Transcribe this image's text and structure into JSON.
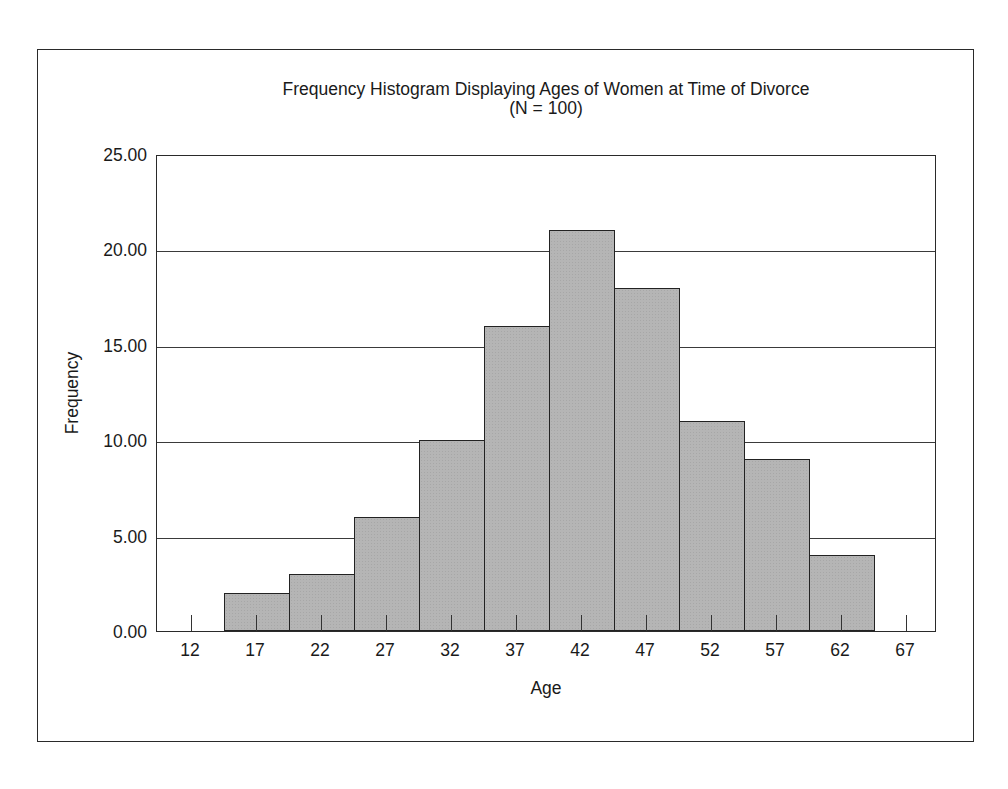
{
  "chart": {
    "title": "Frequency Histogram Displaying Ages of Women at Time of Divorce",
    "subtitle": "(N = 100)",
    "xlabel": "Age",
    "ylabel": "Frequency",
    "y_ticks": [
      "0.00",
      "5.00",
      "10.00",
      "15.00",
      "20.00",
      "25.00"
    ],
    "x_ticks": [
      "12",
      "17",
      "22",
      "27",
      "32",
      "37",
      "42",
      "47",
      "52",
      "57",
      "62",
      "67"
    ],
    "bar_color": "#b5b5b5"
  },
  "chart_data": {
    "type": "bar",
    "title": "Frequency Histogram Displaying Ages of Women at Time of Divorce",
    "subtitle": "(N = 100)",
    "xlabel": "Age",
    "ylabel": "Frequency",
    "categories": [
      "12",
      "17",
      "22",
      "27",
      "32",
      "37",
      "42",
      "47",
      "52",
      "57",
      "62",
      "67"
    ],
    "values": [
      0,
      2,
      3,
      6,
      10,
      16,
      21,
      18,
      11,
      9,
      4,
      0
    ],
    "ylim": [
      0,
      25
    ],
    "y_tick_values": [
      0,
      5,
      10,
      15,
      20,
      25
    ],
    "grid": "horizontal",
    "legend": "none"
  }
}
